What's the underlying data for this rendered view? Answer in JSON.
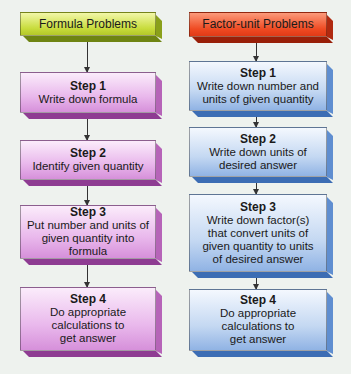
{
  "left": {
    "header": "Formula Problems",
    "steps": [
      {
        "title": "Step 1",
        "lines": [
          "Write down formula"
        ]
      },
      {
        "title": "Step 2",
        "lines": [
          "Identify given quantity"
        ]
      },
      {
        "title": "Step 3",
        "lines": [
          "Put number and units of",
          "given quantity into formula"
        ]
      },
      {
        "title": "Step 4",
        "lines": [
          "Do appropriate",
          "calculations to",
          "get answer"
        ]
      }
    ]
  },
  "right": {
    "header": "Factor-unit Problems",
    "steps": [
      {
        "title": "Step 1",
        "lines": [
          "Write down number and",
          "units of given quantity"
        ]
      },
      {
        "title": "Step 2",
        "lines": [
          "Write down units of",
          "desired answer"
        ]
      },
      {
        "title": "Step 3",
        "lines": [
          "Write down factor(s)",
          "that convert units of",
          "given quantity to units",
          "of desired answer"
        ]
      },
      {
        "title": "Step 4",
        "lines": [
          "Do appropriate",
          "calculations to",
          "get answer"
        ]
      }
    ]
  },
  "colors": {
    "left_header": "#c8dc3c",
    "right_header": "#ef4a22",
    "left_steps": "#e9b8ec",
    "right_steps": "#c4d8f2",
    "background": "#eef2ee"
  }
}
